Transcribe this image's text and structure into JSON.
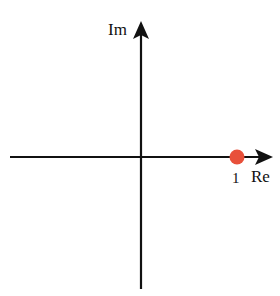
{
  "diagram": {
    "axes": {
      "imaginary_label": "Im",
      "real_label": "Re"
    },
    "point": {
      "label": "1",
      "value": "1 + 0i",
      "color": "#e8503a"
    },
    "axis_color": "#111111"
  }
}
